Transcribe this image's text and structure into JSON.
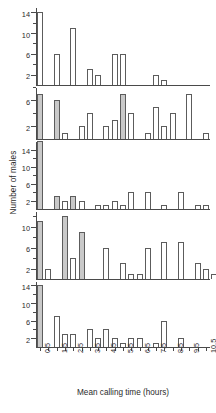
{
  "chart_data": {
    "type": "bar",
    "title": "",
    "xlabel": "Mean calling time (hours)",
    "ylabel": "Number of males",
    "grid": false,
    "legend": null,
    "bin_width": 0.5,
    "x_tick_labels": [
      "0.5",
      "1.5",
      "2.5",
      "3.5",
      "4.5",
      "5.5",
      "6.5",
      "7.5",
      "8.5",
      "9.5",
      "10.5"
    ],
    "x": [
      0.5,
      1.0,
      1.5,
      2.0,
      2.5,
      3.0,
      3.5,
      4.0,
      4.5,
      5.0,
      5.5,
      6.0,
      6.5,
      7.0,
      7.5,
      8.0,
      8.5,
      9.0,
      9.5,
      10.0,
      10.5
    ],
    "xlim": [
      0.25,
      10.75
    ],
    "panels": [
      {
        "name": "panel-1",
        "ylim": [
          0,
          15
        ],
        "y_major_ticks": [
          2,
          6,
          10,
          14
        ],
        "y_minor_ticks": [
          4,
          8,
          12
        ],
        "values": [
          14,
          0,
          6,
          0,
          11,
          0,
          3,
          2,
          0,
          6,
          6,
          0,
          0,
          0,
          2,
          1,
          0,
          0,
          0,
          0,
          0
        ],
        "shaded": [
          false,
          false,
          false,
          false,
          false,
          false,
          false,
          false,
          false,
          false,
          false,
          false,
          false,
          false,
          false,
          false,
          false,
          false,
          false,
          false,
          false
        ]
      },
      {
        "name": "panel-2",
        "ylim": [
          0,
          8
        ],
        "y_major_ticks": [
          2,
          6
        ],
        "y_minor_ticks": [
          4,
          8
        ],
        "values": [
          7,
          0,
          6,
          1,
          0,
          2,
          4,
          0,
          2,
          3,
          7,
          4,
          0,
          1,
          5,
          2,
          4,
          0,
          7,
          0,
          1
        ],
        "shaded": [
          true,
          false,
          true,
          false,
          false,
          false,
          false,
          false,
          false,
          false,
          true,
          false,
          false,
          false,
          false,
          false,
          false,
          false,
          false,
          false,
          false
        ]
      },
      {
        "name": "panel-3",
        "ylim": [
          0,
          16
        ],
        "y_major_ticks": [
          2,
          6,
          10,
          14
        ],
        "y_minor_ticks": [
          4,
          8,
          12
        ],
        "values": [
          16,
          0,
          3,
          2,
          3,
          2,
          0,
          1,
          1,
          2,
          1,
          4,
          0,
          4,
          0,
          1,
          0,
          4,
          0,
          1,
          1
        ],
        "shaded": [
          true,
          false,
          true,
          false,
          true,
          false,
          false,
          false,
          false,
          false,
          false,
          false,
          false,
          false,
          false,
          false,
          false,
          false,
          false,
          false,
          false
        ]
      },
      {
        "name": "panel-4",
        "ylim": [
          0,
          13
        ],
        "y_major_ticks": [
          2,
          6,
          10
        ],
        "y_minor_ticks": [
          4,
          8,
          12
        ],
        "values": [
          11,
          2,
          0,
          12,
          4,
          9,
          0,
          0,
          6,
          0,
          3,
          1,
          1,
          6,
          0,
          7,
          0,
          7,
          0,
          3,
          2,
          1
        ],
        "shaded": [
          true,
          false,
          false,
          true,
          false,
          true,
          false,
          false,
          false,
          false,
          false,
          false,
          false,
          false,
          false,
          false,
          false,
          false,
          false,
          false,
          false
        ]
      },
      {
        "name": "panel-5",
        "ylim": [
          0,
          15
        ],
        "y_major_ticks": [
          2,
          6,
          10,
          14
        ],
        "y_minor_ticks": [
          4,
          8,
          12
        ],
        "values": [
          14,
          0,
          7,
          3,
          3,
          0,
          4,
          2,
          4,
          2,
          1,
          2,
          2,
          0,
          1,
          6,
          0,
          2,
          0,
          0,
          0
        ],
        "shaded": [
          true,
          false,
          false,
          false,
          false,
          false,
          false,
          false,
          false,
          false,
          false,
          false,
          false,
          false,
          false,
          false,
          false,
          false,
          false,
          false,
          false
        ]
      }
    ]
  }
}
